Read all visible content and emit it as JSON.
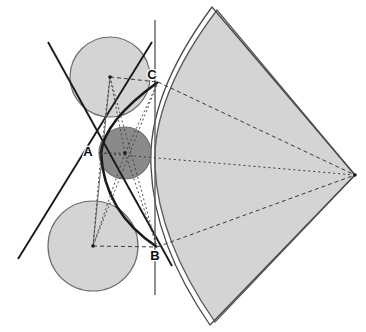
{
  "figure": {
    "width": 366,
    "height": 332,
    "background_color": "#ffffff"
  },
  "palette": {
    "light_fill": "#d4d4d4",
    "dark_fill": "#8a8a8a",
    "outline": "#5a5a5a",
    "stroke_dark": "#1a1a1a",
    "stroke_thin": "#6b6b6b",
    "dotted": "#3a3a3a",
    "label_color": "#0d0d0d"
  },
  "labels": [
    {
      "name": "label-A",
      "text": "A",
      "x": 88,
      "y": 156
    },
    {
      "name": "label-B",
      "text": "B",
      "x": 155,
      "y": 260
    },
    {
      "name": "label-C",
      "text": "C",
      "x": 152,
      "y": 79
    }
  ],
  "circles": [
    {
      "name": "upper-circle",
      "cx": 110,
      "cy": 77,
      "r": 40,
      "fill": "#d4d4d4",
      "stroke": "#6e6e6e",
      "stroke_width": 1.2
    },
    {
      "name": "lower-circle",
      "cx": 93,
      "cy": 246,
      "r": 45,
      "fill": "#d4d4d4",
      "stroke": "#6e6e6e",
      "stroke_width": 1.2
    },
    {
      "name": "inner-dark-circle",
      "cx": 125,
      "cy": 153,
      "r": 26,
      "fill": "#8a8a8a",
      "stroke": "#6e6e6e",
      "stroke_width": 1.2
    }
  ],
  "centers": [
    {
      "name": "center-upper-circle",
      "cx": 110,
      "cy": 77
    },
    {
      "name": "center-lower-circle",
      "cx": 93,
      "cy": 246
    },
    {
      "name": "center-dark-circle",
      "cx": 125,
      "cy": 153
    },
    {
      "name": "sector-apex-point",
      "cx": 355,
      "cy": 175
    }
  ],
  "sector": {
    "name": "circular-sector",
    "apex": {
      "x": 355,
      "y": 175
    },
    "top_vertex": {
      "x": 217,
      "y": 10
    },
    "bottom_vertex": {
      "x": 215,
      "y": 322
    },
    "arc_left_extreme": {
      "x": 155,
      "y": 166
    },
    "fill": "#d4d4d4",
    "stroke": "#5a5a5a",
    "stroke_width": 1.3,
    "path": "M 355 175 L 217 10 Q 152 96 155 166 Q 158 240 215 322 Z"
  },
  "sector_outline_extra": {
    "name": "sector-outer-edge-highlight",
    "path": "M 355 175 L 212 7 Q 147 95 151 167 Q 154 244 210 325 Z",
    "stroke": "#4a4a4a",
    "stroke_width": 1.3
  },
  "solid_lines": [
    {
      "name": "tangent-line-upper-left",
      "x1": 18,
      "y1": 259,
      "x2": 152,
      "y2": 42,
      "stroke": "#1a1a1a",
      "stroke_width": 1.9
    },
    {
      "name": "tangent-line-lower-left",
      "x1": 48,
      "y1": 42,
      "x2": 172,
      "y2": 266,
      "stroke": "#1a1a1a",
      "stroke_width": 1.9
    },
    {
      "name": "vertical-line-BC",
      "x1": 155,
      "y1": 20,
      "x2": 155,
      "y2": 295,
      "stroke": "#5e5e5e",
      "stroke_width": 1.4
    },
    {
      "name": "thin-line-through-A",
      "x1": 110,
      "y1": 77,
      "x2": 93,
      "y2": 246,
      "stroke": "#6b6b6b",
      "stroke_width": 1.0
    }
  ],
  "thick_conic": {
    "name": "conic-arc-C-A-B",
    "path": "M 158 82 Q 104 121 101 153 Q 104 212 157 247",
    "stroke": "#1a1a1a",
    "stroke_width": 2.6
  },
  "dashed_lines": [
    {
      "name": "dashed-radius-upper-to-C",
      "x1": 110,
      "y1": 77,
      "x2": 158,
      "y2": 82,
      "dash": "4 3"
    },
    {
      "name": "dashed-C-to-apex",
      "x1": 158,
      "y1": 82,
      "x2": 355,
      "y2": 175,
      "dash": "4 3"
    },
    {
      "name": "dashed-radius-lower-to-B",
      "x1": 93,
      "y1": 246,
      "x2": 157,
      "y2": 247,
      "dash": "4 3"
    },
    {
      "name": "dashed-B-to-apex",
      "x1": 157,
      "y1": 247,
      "x2": 355,
      "y2": 175,
      "dash": "4 3"
    },
    {
      "name": "dashed-center-axis-to-apex",
      "x1": 99,
      "y1": 153,
      "x2": 355,
      "y2": 175,
      "dash": "2 3"
    }
  ],
  "dotted_lines": [
    {
      "name": "dotted-upper-center-to-A",
      "x1": 110,
      "y1": 77,
      "x2": 101,
      "y2": 153,
      "dash": "2 2.5"
    },
    {
      "name": "dotted-upper-center-to-B",
      "x1": 110,
      "y1": 77,
      "x2": 157,
      "y2": 247,
      "dash": "2 2.5"
    },
    {
      "name": "dotted-lower-center-to-A",
      "x1": 93,
      "y1": 246,
      "x2": 101,
      "y2": 153,
      "dash": "2 2.5"
    },
    {
      "name": "dotted-lower-center-to-C",
      "x1": 93,
      "y1": 246,
      "x2": 158,
      "y2": 82,
      "dash": "2 2.5"
    },
    {
      "name": "dotted-dark-center-to-A",
      "x1": 125,
      "y1": 153,
      "x2": 101,
      "y2": 153,
      "dash": "2 2.5"
    },
    {
      "name": "dotted-dark-center-to-C",
      "x1": 125,
      "y1": 153,
      "x2": 158,
      "y2": 82,
      "dash": "2 2.5"
    },
    {
      "name": "dotted-dark-center-to-B",
      "x1": 125,
      "y1": 153,
      "x2": 157,
      "y2": 247,
      "dash": "2 2.5"
    },
    {
      "name": "dotted-dark-center-to-upper",
      "x1": 125,
      "y1": 153,
      "x2": 110,
      "y2": 77,
      "dash": "2 2.5"
    },
    {
      "name": "dotted-dark-center-to-lower",
      "x1": 125,
      "y1": 153,
      "x2": 93,
      "y2": 246,
      "dash": "2 2.5"
    }
  ]
}
